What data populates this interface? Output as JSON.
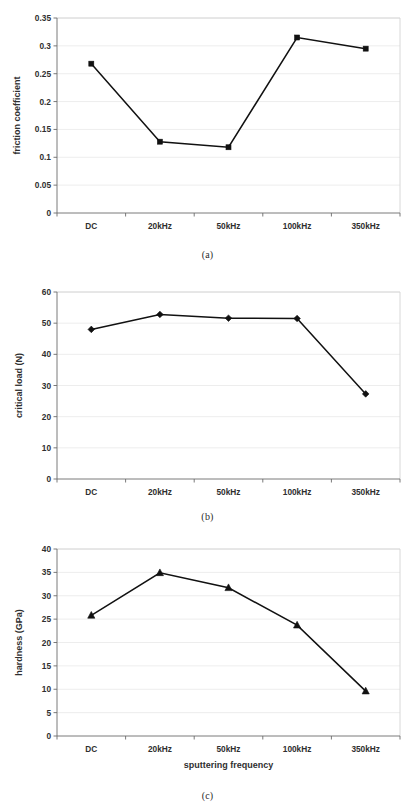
{
  "document": {
    "type": "figure-panel",
    "panel_count": 3,
    "background_color": "#ffffff",
    "ink_color": "#111111",
    "gridline_color": "#e9e9e9"
  },
  "figures": [
    {
      "id": "a",
      "caption": "(a)"
    },
    {
      "id": "b",
      "caption": "(b)"
    },
    {
      "id": "c",
      "caption": "(c)"
    }
  ],
  "chart_data": [
    {
      "id": "a",
      "type": "line",
      "title": "",
      "xlabel": "",
      "ylabel": "friction coefficient",
      "categories": [
        "DC",
        "20kHz",
        "50kHz",
        "100kHz",
        "350kHz"
      ],
      "values": [
        0.268,
        0.128,
        0.118,
        0.315,
        0.295
      ],
      "ylim": [
        0,
        0.35
      ],
      "yticks": [
        0,
        0.05,
        0.1,
        0.15,
        0.2,
        0.25,
        0.3,
        0.35
      ],
      "ytick_labels": [
        "0",
        "0.05",
        "0.1",
        "0.15",
        "0.2",
        "0.25",
        "0.3",
        "0.35"
      ],
      "marker": "square",
      "grid": true,
      "legend": false,
      "caption": "(a)"
    },
    {
      "id": "b",
      "type": "line",
      "title": "",
      "xlabel": "",
      "ylabel": "critical load (N)",
      "categories": [
        "DC",
        "20kHz",
        "50kHz",
        "100kHz",
        "350kHz"
      ],
      "values": [
        48.0,
        52.8,
        51.6,
        51.5,
        27.3
      ],
      "ylim": [
        0,
        60
      ],
      "yticks": [
        0,
        10,
        20,
        30,
        40,
        50,
        60
      ],
      "ytick_labels": [
        "0",
        "10",
        "20",
        "30",
        "40",
        "50",
        "60"
      ],
      "marker": "diamond",
      "grid": true,
      "legend": false,
      "caption": "(b)"
    },
    {
      "id": "c",
      "type": "line",
      "title": "",
      "xlabel": "sputtering frequency",
      "ylabel": "hardness (GPa)",
      "categories": [
        "DC",
        "20kHz",
        "50kHz",
        "100kHz",
        "350kHz"
      ],
      "values": [
        25.8,
        34.9,
        31.7,
        23.7,
        9.6
      ],
      "ylim": [
        0,
        40
      ],
      "yticks": [
        0,
        5,
        10,
        15,
        20,
        25,
        30,
        35,
        40
      ],
      "ytick_labels": [
        "0",
        "5",
        "10",
        "15",
        "20",
        "25",
        "30",
        "35",
        "40"
      ],
      "marker": "triangle",
      "grid": true,
      "legend": false,
      "caption": "(c)"
    }
  ]
}
